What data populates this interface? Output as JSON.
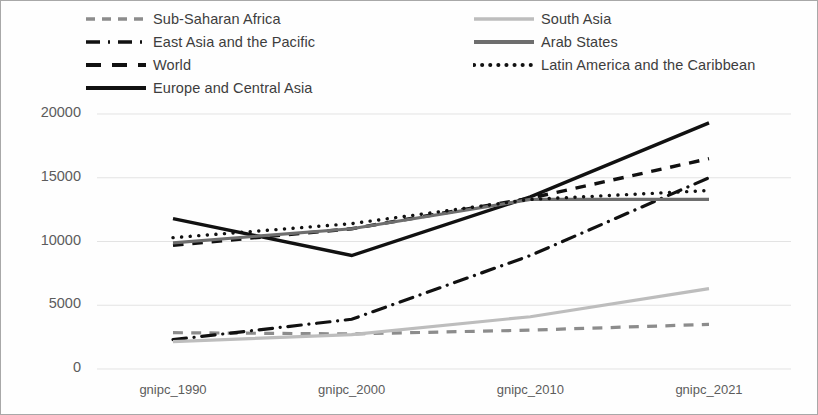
{
  "chart_data": {
    "type": "line",
    "title": "",
    "xlabel": "",
    "ylabel": "",
    "categories": [
      "gnipc_1990",
      "gnipc_2000",
      "gnipc_2010",
      "gnipc_2021"
    ],
    "ylim": [
      0,
      20000
    ],
    "y_ticks": [
      "0",
      "5000",
      "10000",
      "15000",
      "20000"
    ],
    "y_tick_values": [
      0,
      5000,
      10000,
      15000,
      20000
    ],
    "grid": true,
    "legend_position": "top",
    "series": [
      {
        "name": "Sub-Saharan Africa",
        "style": "dashed",
        "color": "#8c8c8c",
        "width": 3.2,
        "values": [
          2850,
          2750,
          3050,
          3500
        ]
      },
      {
        "name": "East Asia and the Pacific",
        "style": "dashdot",
        "color": "#111111",
        "width": 3.2,
        "values": [
          2300,
          3900,
          8900,
          15000
        ]
      },
      {
        "name": "World",
        "style": "dashed",
        "color": "#111111",
        "width": 3.4,
        "values": [
          9700,
          11000,
          13400,
          16500
        ]
      },
      {
        "name": "Europe and Central Asia",
        "style": "solid",
        "color": "#111111",
        "width": 3.4,
        "values": [
          11800,
          8900,
          13500,
          19300
        ]
      },
      {
        "name": "South Asia",
        "style": "solid",
        "color": "#bdbdbd",
        "width": 3.2,
        "values": [
          2150,
          2700,
          4100,
          6300
        ]
      },
      {
        "name": "Arab States",
        "style": "solid",
        "color": "#6e6e6e",
        "width": 3.2,
        "values": [
          9900,
          11000,
          13300,
          13300
        ]
      },
      {
        "name": "Latin America and the Caribbean",
        "style": "dotted",
        "color": "#111111",
        "width": 3.4,
        "values": [
          10300,
          11400,
          13300,
          14000
        ]
      }
    ]
  },
  "axis": {
    "x_labels": [
      "gnipc_1990",
      "gnipc_2000",
      "gnipc_2010",
      "gnipc_2021"
    ],
    "y_labels": [
      "20000",
      "15000",
      "10000",
      "5000",
      "0"
    ]
  },
  "legend": {
    "left_column": [
      {
        "label": "Sub-Saharan Africa",
        "icon": "dashed-line-swatch-icon"
      },
      {
        "label": "East Asia and the Pacific",
        "icon": "dashdot-line-swatch-icon"
      },
      {
        "label": "World",
        "icon": "dashed-line-swatch-icon"
      },
      {
        "label": "Europe and Central Asia",
        "icon": "solid-line-swatch-icon"
      }
    ],
    "right_column": [
      {
        "label": "South Asia",
        "icon": "solid-light-line-swatch-icon"
      },
      {
        "label": "Arab States",
        "icon": "solid-gray-line-swatch-icon"
      },
      {
        "label": "Latin America and the Caribbean",
        "icon": "dotted-line-swatch-icon"
      }
    ]
  },
  "colors": {
    "grid": "#e3e3e3",
    "frame": "#a8a8a8",
    "tick_text": "#5c5c5c",
    "legend_text": "#3d3d3d"
  }
}
